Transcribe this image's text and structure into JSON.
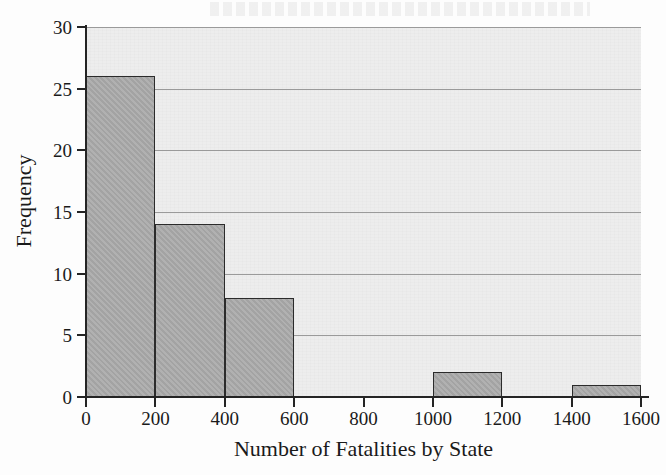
{
  "chart_data": {
    "type": "bar",
    "title": "",
    "xlabel": "Number of Fatalities by State",
    "ylabel": "Frequency",
    "categories": [
      "0-200",
      "200-400",
      "400-600",
      "600-800",
      "800-1000",
      "1000-1200",
      "1200-1400",
      "1400-1600"
    ],
    "bin_edges": [
      0,
      200,
      400,
      600,
      800,
      1000,
      1200,
      1400,
      1600
    ],
    "bin_width": 200,
    "values": [
      26,
      14,
      8,
      0,
      0,
      2,
      0,
      1
    ],
    "xlim": [
      0,
      1600
    ],
    "ylim": [
      0,
      30
    ],
    "xticks": [
      0,
      200,
      400,
      600,
      800,
      1000,
      1200,
      1400,
      1600
    ],
    "yticks": [
      0,
      5,
      10,
      15,
      20,
      25,
      30
    ],
    "xtick_labels": [
      "0",
      "200",
      "400",
      "600",
      "800",
      "1000",
      "1200",
      "1400",
      "1600"
    ],
    "ytick_labels": [
      "0",
      "5",
      "10",
      "15",
      "20",
      "25",
      "30"
    ],
    "grid": "horizontal",
    "legend": "none",
    "colors": {
      "bar_fill": "#a8a8a8",
      "bar_edge": "#2b2b2b",
      "plot_background": "#ededed",
      "gridline": "#9a9a9a",
      "axis": "#242424",
      "text": "#1a1a1a",
      "page_background": "#fdfdfd"
    }
  }
}
